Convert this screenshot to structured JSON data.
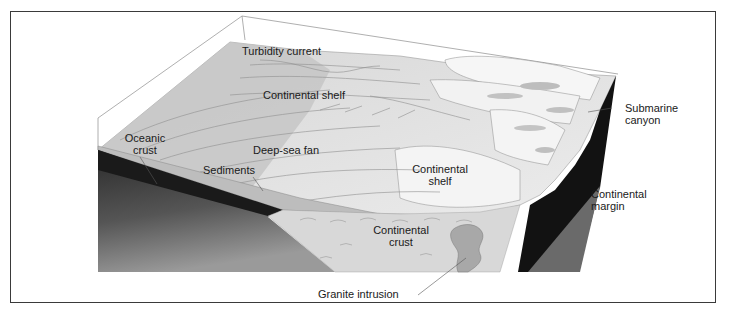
{
  "figure": {
    "type": "block-diagram",
    "colors": {
      "frame": "#3a3a3a",
      "surface_light": "#ececec",
      "surface_mid": "#cfcfcf",
      "surface_dark": "#b5b5b5",
      "crust_dark": "#141414",
      "crust_gradient_light": "#8a8a8a",
      "margin_gray": "#6e6e6e",
      "continental_crust": "#dcdcdc",
      "granite": "#a9a9a9"
    }
  },
  "labels": {
    "turbidity_current": "Turbidity current",
    "continental_shelf_top": "Continental shelf",
    "oceanic_crust_line1": "Oceanic",
    "oceanic_crust_line2": "crust",
    "deep_sea_fan": "Deep-sea fan",
    "sediments": "Sediments",
    "continental_shelf_line1": "Continental",
    "continental_shelf_line2": "shelf",
    "continental_crust_line1": "Continental",
    "continental_crust_line2": "crust",
    "submarine_canyon_line1": "Submarine",
    "submarine_canyon_line2": "canyon",
    "continental_margin_line1": "Continental",
    "continental_margin_line2": "margin",
    "granite_intrusion": "Granite intrusion"
  }
}
